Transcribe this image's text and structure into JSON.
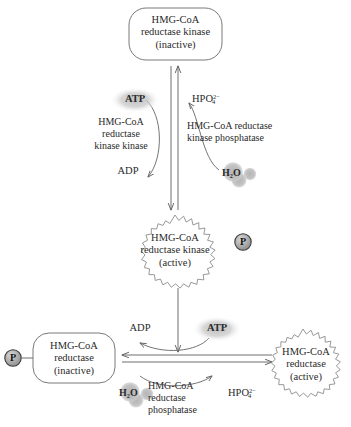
{
  "diagram": {
    "colors": {
      "stroke": "#6e6e6e",
      "text": "#2a2a2a",
      "glow": "#c9c9c9",
      "badge": "#9a9a9a",
      "badge_edge": "#3a3a3a",
      "active_border": "#8c8c8c",
      "inactive_border": "#7a7a7a"
    }
  },
  "nodes": {
    "kinase_inactive": {
      "line1": "HMG-CoA",
      "line2": "reductase kinase",
      "line3": "(inactive)",
      "state": "inactive",
      "shape": "rounded-rect"
    },
    "kinase_active": {
      "line1": "HMG-CoA",
      "line2": "reductase kinase",
      "line3": "(active)",
      "state": "active",
      "shape": "starburst",
      "badge": "P"
    },
    "reductase_inactive": {
      "line1": "HMG-CoA",
      "line2": "reductase",
      "line3": "(inactive)",
      "state": "inactive",
      "shape": "rounded-rect",
      "badge": "P"
    },
    "reductase_active": {
      "line1": "HMG-CoA",
      "line2": "reductase",
      "line3": "(active)",
      "state": "active",
      "shape": "starburst"
    }
  },
  "upper_cycle": {
    "substrate_in": "ATP",
    "product_out": "ADP",
    "enzyme_left_l1": "HMG-CoA",
    "enzyme_left_l2": "reductase",
    "enzyme_left_l3": "kinase kinase",
    "enzyme_right_l1": "HMG-CoA reductase",
    "enzyme_right_l2": "kinase phosphatase",
    "water_in": "H",
    "water_in_sub": "2",
    "water_in_tail": "O",
    "phosphate_out_main": "HPO",
    "phosphate_out_sub": "4",
    "phosphate_out_sup": "2−"
  },
  "lower_cycle": {
    "substrate_in": "ATP",
    "product_out": "ADP",
    "enzyme_l1": "HMG-CoA",
    "enzyme_l2": "reductase",
    "enzyme_l3": "phosphatase",
    "water_in": "H",
    "water_in_sub": "2",
    "water_in_tail": "O",
    "phosphate_out_main": "HPO",
    "phosphate_out_sub": "4",
    "phosphate_out_sup": "2−"
  },
  "badges": {
    "phosphate_symbol": "P"
  }
}
